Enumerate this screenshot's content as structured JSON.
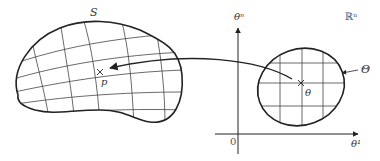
{
  "diagram": {
    "manifold": {
      "label": "S",
      "point_label": "p"
    },
    "parameter_space": {
      "space_label": "ℝⁿ",
      "region_label": "Θ",
      "point_label": "θ",
      "x_axis_label": "θ¹",
      "y_axis_label": "θⁿ",
      "origin_label": "0"
    },
    "mapping_arrow": {
      "from": "θ",
      "to": "p"
    },
    "colors": {
      "stroke": "#222222",
      "grid": "#444444",
      "text": "#333333"
    }
  }
}
